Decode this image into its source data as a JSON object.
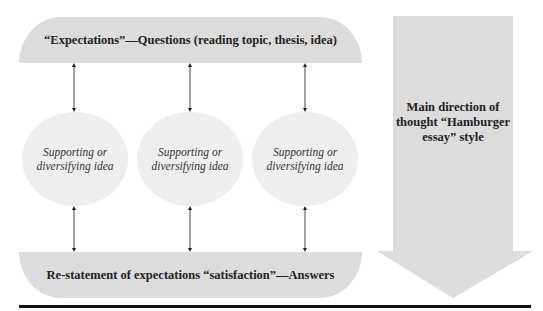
{
  "diagram": {
    "top_bar": {
      "label": "“Expectations”—Questions (reading topic, thesis, idea)"
    },
    "circles": [
      {
        "label": "Supporting or diversifying idea"
      },
      {
        "label": "Supporting or diversifying idea"
      },
      {
        "label": "Supporting or diversifying idea"
      }
    ],
    "bottom_bar": {
      "label": "Re-statement of expectations “satisfaction”—Answers"
    },
    "direction_arrow": {
      "label": "Main direction of thought “Hamburger essay” style"
    },
    "colors": {
      "bar_fill": "#dcdcdc",
      "circle_fill": "#eeeeee",
      "line": "#111111"
    }
  }
}
